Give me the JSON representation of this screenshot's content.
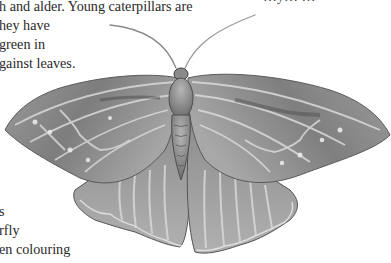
{
  "page": {
    "type": "illustrated natural history book page (cropped)",
    "colors": {
      "text": "#2a2a2a",
      "background": "#ffffff",
      "moth_base": "#8e8e8e",
      "moth_dark": "#5a5a5a",
      "moth_light": "#d8d8d8"
    }
  },
  "text_top": {
    "cut_line": "…y… …",
    "lines": [
      "h and alder. Young caterpillars are",
      "hey have",
      "green in",
      "gainst leaves."
    ]
  },
  "text_bottom": {
    "lines": [
      "s",
      "rfly",
      "en colouring"
    ]
  },
  "illustration": {
    "subject": "moth",
    "label": "moth-illustration"
  }
}
